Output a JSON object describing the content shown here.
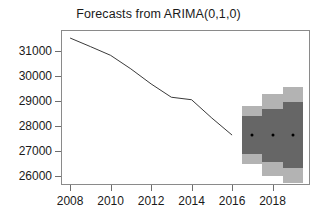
{
  "chart_data": {
    "type": "line",
    "title": "Forecasts from ARIMA(0,1,0)",
    "xlabel": "",
    "ylabel": "",
    "xlim": [
      2007.6,
      2019.8
    ],
    "ylim": [
      25700,
      31800
    ],
    "grid": false,
    "legend": null,
    "xticks": [
      2008,
      2010,
      2012,
      2014,
      2016,
      2018
    ],
    "yticks": [
      26000,
      27000,
      28000,
      29000,
      30000,
      31000
    ],
    "ytick_labels": [
      "26000",
      "27000",
      "28000",
      "29000",
      "30000",
      "31000"
    ],
    "xtick_labels": [
      "2008",
      "2010",
      "2012",
      "2014",
      "2016",
      "2018"
    ],
    "series": [
      {
        "name": "historical",
        "type": "line",
        "color": "#3a3a3a",
        "x": [
          2008.0,
          2009.0,
          2010.0,
          2011.0,
          2012.0,
          2013.0,
          2014.0,
          2015.0,
          2016.0
        ],
        "values": [
          31520,
          31180,
          30830,
          30290,
          29690,
          29160,
          29060,
          28330,
          27650
        ]
      },
      {
        "name": "point forecast",
        "type": "scatter",
        "color": "#000000",
        "x": [
          2017,
          2018,
          2019
        ],
        "values": [
          27650,
          27650,
          27650
        ]
      }
    ],
    "intervals": [
      {
        "name": "80% prediction interval",
        "level": 80,
        "color": "#666666",
        "x": [
          2017,
          2018,
          2019
        ],
        "lower": [
          26900,
          26590,
          26350
        ],
        "upper": [
          28400,
          28710,
          28950
        ]
      },
      {
        "name": "95% prediction interval",
        "level": 95,
        "color": "#b3b3b3",
        "x": [
          2017,
          2018,
          2019
        ],
        "lower": [
          26500,
          26000,
          25720
        ],
        "upper": [
          28800,
          29300,
          29580
        ]
      }
    ]
  },
  "axes": {
    "frame_color": "#8a8a8a",
    "tick_color": "#6e6e6e"
  },
  "colors": {
    "background": "#ffffff",
    "line": "#3a3a3a",
    "pi80": "#666666",
    "pi95": "#b3b3b3",
    "point": "#000000",
    "text": "#1a1a1a"
  }
}
